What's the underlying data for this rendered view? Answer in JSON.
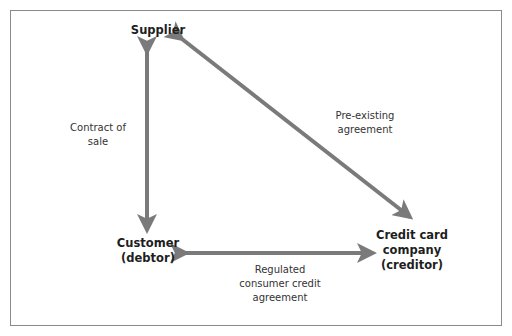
{
  "nodes": {
    "supplier": "Supplier",
    "customer_line1": "Customer",
    "customer_line2": "(debtor)",
    "creditor_line1": "Credit card",
    "creditor_line2": "company",
    "creditor_line3": "(creditor)"
  },
  "edges": {
    "contract_line1": "Contract of",
    "contract_line2": "sale",
    "preexisting_line1": "Pre-existing",
    "preexisting_line2": "agreement",
    "regulated_line1": "Regulated",
    "regulated_line2": "consumer credit",
    "regulated_line3": "agreement"
  },
  "colors": {
    "arrow": "#7a7a7a",
    "frame": "#8a8a8a",
    "text": "#1e1e1e"
  }
}
